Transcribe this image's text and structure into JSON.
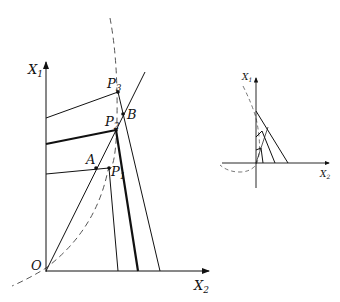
{
  "main_diagram": {
    "axes": {
      "y_label": "X",
      "y_sub": "1",
      "x_label": "X",
      "x_sub": "2",
      "origin_label": "O"
    },
    "points": [
      {
        "name": "P",
        "sub": "3"
      },
      {
        "name": "B",
        "sub": ""
      },
      {
        "name": "P",
        "sub": "2"
      },
      {
        "name": "A",
        "sub": ""
      },
      {
        "name": "P",
        "sub": "1"
      }
    ]
  },
  "inset_diagram": {
    "axes": {
      "y_label": "X",
      "y_sub": "1",
      "x_label": "X",
      "x_sub": "2"
    }
  },
  "colors": {
    "line": "#111111",
    "dashed": "#555555",
    "background": "#ffffff"
  }
}
